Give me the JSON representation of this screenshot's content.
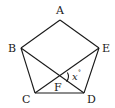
{
  "diagram": {
    "type": "geometry",
    "shape": "regular pentagon with two diagonals",
    "vertices": {
      "A": {
        "label": "A",
        "x": 60,
        "y": 20
      },
      "B": {
        "label": "B",
        "x": 21,
        "y": 48
      },
      "C": {
        "label": "C",
        "x": 35,
        "y": 93
      },
      "D": {
        "label": "D",
        "x": 84,
        "y": 93
      },
      "E": {
        "label": "E",
        "x": 99,
        "y": 48
      },
      "F": {
        "label": "F",
        "x": 60,
        "y": 77
      }
    },
    "edges": [
      "AB",
      "BC",
      "CD",
      "DE",
      "EA",
      "BD",
      "CE"
    ],
    "intersection": {
      "point": "F",
      "of": [
        "BD",
        "CE"
      ]
    },
    "angle": {
      "variable": "x",
      "unit": "°",
      "label": "x°",
      "at": "F",
      "between": [
        "FE",
        "FD"
      ]
    }
  },
  "labels": {
    "A": "A",
    "B": "B",
    "C": "C",
    "D": "D",
    "E": "E",
    "F": "F",
    "angle_var": "x",
    "angle_unit": "°"
  },
  "colors": {
    "stroke": "#1a1a1a",
    "background": "#ffffff"
  }
}
